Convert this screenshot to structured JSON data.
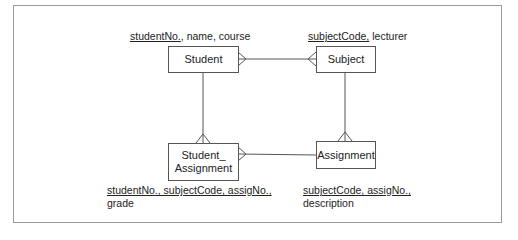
{
  "diagram": {
    "type": "entity-relationship",
    "entities": [
      {
        "id": "student",
        "label": "Student",
        "attributes_key": "studentNo.",
        "attributes_rest": ", name, course"
      },
      {
        "id": "subject",
        "label": "Subject",
        "attributes_key": "subjectCode,",
        "attributes_rest": " lecturer"
      },
      {
        "id": "student_assignment",
        "label_line1": "Student_",
        "label_line2": "Assignment",
        "attributes_key": "studentNo., subjectCode, assigNo.,",
        "attributes_rest_line2": "grade"
      },
      {
        "id": "assignment",
        "label": "Assignment",
        "attributes_key": "subjectCode, assigNo.,",
        "attributes_rest_line2": "description"
      }
    ],
    "relationships": [
      {
        "from": "student",
        "to": "subject",
        "cardinality": "many-to-many"
      },
      {
        "from": "student",
        "to": "student_assignment",
        "cardinality": "one-to-many"
      },
      {
        "from": "subject",
        "to": "assignment",
        "cardinality": "one-to-many"
      },
      {
        "from": "student_assignment",
        "to": "assignment",
        "cardinality": "many-to-one"
      }
    ]
  }
}
